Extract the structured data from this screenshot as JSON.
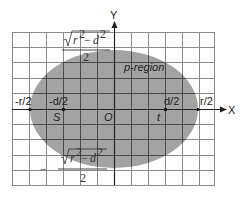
{
  "diagram": {
    "type": "ellipse-region-on-grid",
    "axes": {
      "x_label": "X",
      "y_label": "Y",
      "origin_label": "O"
    },
    "x_ticks": [
      {
        "label": "-r/2",
        "value": "-r/2"
      },
      {
        "label": "-d/2",
        "value": "-d/2"
      },
      {
        "label": "d/2",
        "value": "d/2"
      },
      {
        "label": "r/2",
        "value": "r/2"
      }
    ],
    "points": [
      {
        "label": "S",
        "at": "-d/2"
      },
      {
        "label": "t",
        "at": "d/2"
      }
    ],
    "region_label": "p-region",
    "top_formula": {
      "numerator_radicand": "r² − d²",
      "r_sup": "2",
      "d_sup": "2",
      "r": "r",
      "d": "d",
      "minus": "−",
      "denominator": "2",
      "sign": ""
    },
    "bottom_formula": {
      "r": "r",
      "d": "d",
      "r_sup": "2",
      "d_sup": "2",
      "minus": "−",
      "denominator": "2",
      "sign": "−"
    },
    "colors": {
      "region_fill": "#a3a3a3",
      "grid_outside": "#8a8a8a",
      "grid_inside": "#4a4a4a",
      "axis": "#222222"
    }
  }
}
